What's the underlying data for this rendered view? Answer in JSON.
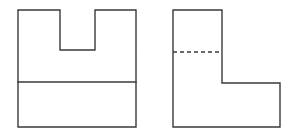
{
  "diagram": {
    "type": "orthographic-projection",
    "colors": {
      "line": "#3a3a3a",
      "background": "#ffffff"
    },
    "views": [
      {
        "name": "front-view",
        "outline": [
          [
            18,
            10
          ],
          [
            60,
            10
          ],
          [
            60,
            50
          ],
          [
            95,
            50
          ],
          [
            95,
            10
          ],
          [
            136,
            10
          ],
          [
            136,
            127
          ],
          [
            18,
            127
          ]
        ],
        "visible_lines": [
          {
            "from": [
              18,
              82
            ],
            "to": [
              136,
              82
            ]
          }
        ],
        "hidden_lines": []
      },
      {
        "name": "side-view",
        "outline": [
          [
            173,
            10
          ],
          [
            222,
            10
          ],
          [
            222,
            83
          ],
          [
            280,
            83
          ],
          [
            280,
            127
          ],
          [
            173,
            127
          ]
        ],
        "visible_lines": [],
        "hidden_lines": [
          {
            "from": [
              173,
              52
            ],
            "to": [
              222,
              52
            ]
          }
        ]
      }
    ]
  }
}
